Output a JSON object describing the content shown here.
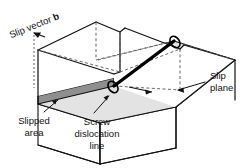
{
  "figure": {
    "labels": {
      "slip_vector": "Slip vector",
      "slip_vector_symbol": "b",
      "slipped_area_line1": "Slipped",
      "slipped_area_line2": "area",
      "screw_line1": "Screw",
      "screw_line2": "dislocation",
      "screw_line3": "line",
      "slip_plane_line1": "Slip",
      "slip_plane_line2": "plane"
    },
    "colors": {
      "background": "#ffffff",
      "outline": "#111111",
      "slipped_area_fill": "#9b9b9b",
      "unslipped_plane_fill": "#e3e3e3",
      "step_face_fill": "#8f8f8f",
      "dislocation_line": "#000000",
      "dashed_hidden_edges": "#555555",
      "leader_line": "#111111"
    },
    "geometry": {
      "block_top_front_left": [
        38,
        64
      ],
      "block_top_front_right": [
        176,
        107
      ],
      "block_top_back_right": [
        235,
        60
      ],
      "block_top_back_left": [
        96,
        22
      ],
      "block_height": 52,
      "step_offset_px": 9
    }
  }
}
